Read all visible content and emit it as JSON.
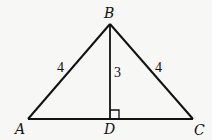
{
  "diagram": {
    "type": "geometry-triangle",
    "points": {
      "A": {
        "label": "A",
        "x": 28,
        "y": 119
      },
      "B": {
        "label": "B",
        "x": 110,
        "y": 24
      },
      "C": {
        "label": "C",
        "x": 193,
        "y": 119
      },
      "D": {
        "label": "D",
        "x": 110,
        "y": 119
      }
    },
    "segments": [
      {
        "from": "A",
        "to": "B",
        "length_label": "4"
      },
      {
        "from": "B",
        "to": "C",
        "length_label": "4"
      },
      {
        "from": "B",
        "to": "D",
        "length_label": "3"
      },
      {
        "from": "A",
        "to": "C",
        "length_label": ""
      }
    ],
    "right_angle_at": "D",
    "colors": {
      "stroke": "#111111",
      "background": "#f7f7f5"
    }
  }
}
